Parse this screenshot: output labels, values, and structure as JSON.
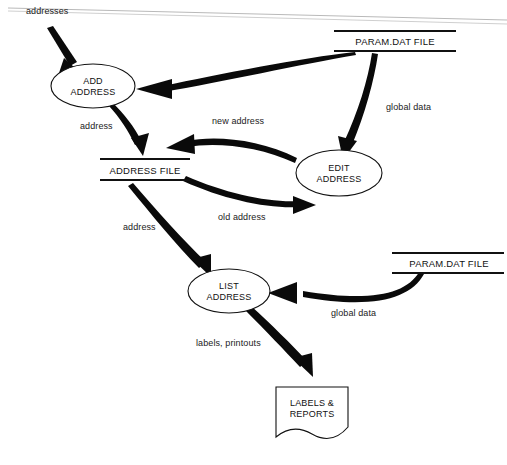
{
  "diagram": {
    "type": "data-flow-diagram",
    "background_color": "#ffffff",
    "line_color": "#111111",
    "processes": [
      {
        "id": "add-address",
        "label_line1": "ADD",
        "label_line2": "ADDRESS",
        "shape": "ellipse",
        "cx": 93,
        "cy": 86,
        "rx": 42,
        "ry": 22
      },
      {
        "id": "edit-address",
        "label_line1": "EDIT",
        "label_line2": "ADDRESS",
        "shape": "ellipse",
        "cx": 339,
        "cy": 173,
        "rx": 43,
        "ry": 23
      },
      {
        "id": "list-address",
        "label_line1": "LIST",
        "label_line2": "ADDRESS",
        "shape": "ellipse",
        "cx": 229,
        "cy": 291,
        "rx": 41,
        "ry": 22
      }
    ],
    "data_stores": [
      {
        "id": "param-dat-file-top",
        "label": "PARAM.DAT FILE",
        "shape": "open-rectangle",
        "x": 334,
        "y": 30,
        "width": 122,
        "height": 22
      },
      {
        "id": "address-file",
        "label": "ADDRESS FILE",
        "shape": "open-rectangle",
        "x": 100,
        "y": 158,
        "width": 90,
        "height": 22
      },
      {
        "id": "param-dat-file-bottom",
        "label": "PARAM.DAT FILE",
        "shape": "open-rectangle",
        "x": 392,
        "y": 252,
        "width": 112,
        "height": 22
      }
    ],
    "external_entities": [
      {
        "id": "labels-and-reports",
        "label_line1": "LABELS &",
        "label_line2": "REPORTS",
        "shape": "document",
        "x": 276,
        "y": 387,
        "width": 72,
        "height": 50
      }
    ],
    "flows": [
      {
        "id": "flow-addresses",
        "label": "addresses",
        "from": "external-source",
        "to": "add-address",
        "label_x": 26,
        "label_y": 14
      },
      {
        "id": "flow-global-data-to-add",
        "label": "",
        "from": "param-dat-file-top",
        "to": "add-address"
      },
      {
        "id": "flow-address-to-store",
        "label": "address",
        "from": "add-address",
        "to": "address-file",
        "label_x": 80,
        "label_y": 129
      },
      {
        "id": "flow-new-address",
        "label": "new address",
        "from": "edit-address",
        "to": "address-file",
        "label_x": 212,
        "label_y": 124
      },
      {
        "id": "flow-global-data-to-edit",
        "label": "global data",
        "from": "param-dat-file-top",
        "to": "edit-address",
        "label_x": 386,
        "label_y": 110
      },
      {
        "id": "flow-old-address",
        "label": "old address",
        "from": "address-file",
        "to": "edit-address",
        "label_x": 218,
        "label_y": 220
      },
      {
        "id": "flow-address-to-list",
        "label": "address",
        "from": "address-file",
        "to": "list-address",
        "label_x": 123,
        "label_y": 230
      },
      {
        "id": "flow-global-data-to-list",
        "label": "global data",
        "from": "param-dat-file-bottom",
        "to": "list-address",
        "label_x": 331,
        "label_y": 316
      },
      {
        "id": "flow-labels-printouts",
        "label": "labels, printouts",
        "from": "list-address",
        "to": "labels-and-reports",
        "label_x": 196,
        "label_y": 346
      }
    ]
  }
}
